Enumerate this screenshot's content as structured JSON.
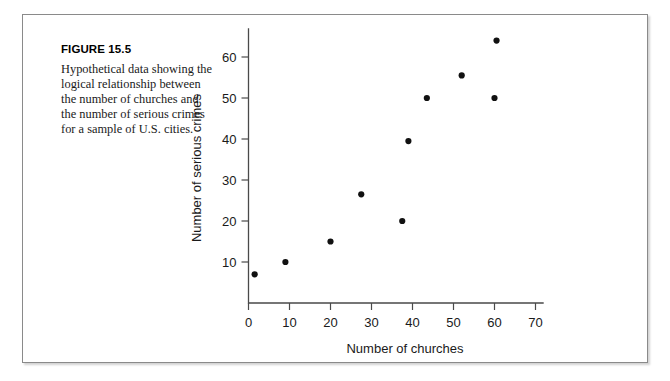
{
  "figure": {
    "number_label": "FIGURE 15.5",
    "caption": "Hypothetical data showing the logical relationship between the number of churches and the number of serious crimes for a sample of U.S. cities."
  },
  "chart_data": {
    "type": "scatter",
    "title": "",
    "xlabel": "Number of churches",
    "ylabel": "Number of serious crimes",
    "xlim": [
      0,
      72
    ],
    "ylim": [
      0,
      67
    ],
    "xticks": [
      0,
      10,
      20,
      30,
      40,
      50,
      60,
      70
    ],
    "xtick_labels": [
      "0",
      "10",
      "20",
      "30",
      "40",
      "50",
      "60",
      "70"
    ],
    "yticks": [
      10,
      20,
      30,
      40,
      50,
      60
    ],
    "ytick_labels": [
      "10",
      "20",
      "30",
      "40",
      "50",
      "60"
    ],
    "grid": false,
    "legend": false,
    "marker_color": "#111111",
    "axis_color": "#4a4a4a",
    "points": [
      {
        "x": 1.5,
        "y": 7.0
      },
      {
        "x": 9.0,
        "y": 10.0
      },
      {
        "x": 20.0,
        "y": 15.0
      },
      {
        "x": 27.5,
        "y": 26.5
      },
      {
        "x": 37.5,
        "y": 20.0
      },
      {
        "x": 39.0,
        "y": 39.5
      },
      {
        "x": 43.5,
        "y": 50.0
      },
      {
        "x": 52.0,
        "y": 55.5
      },
      {
        "x": 60.0,
        "y": 50.0
      },
      {
        "x": 60.5,
        "y": 64.0
      }
    ]
  }
}
